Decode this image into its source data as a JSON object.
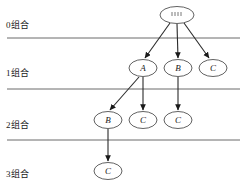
{
  "diagram": {
    "levels": [
      {
        "id": "level-0",
        "label": "0组合",
        "label_x": 6,
        "label_y": 18
      },
      {
        "id": "level-1",
        "label": "1组合",
        "label_x": 6,
        "label_y": 66
      },
      {
        "id": "level-2",
        "label": "2组合",
        "label_x": 6,
        "label_y": 118
      },
      {
        "id": "level-3",
        "label": "3组合",
        "label_x": 6,
        "label_y": 167
      }
    ],
    "dividers": [
      {
        "id": "divider-0-1",
        "y": 38
      },
      {
        "id": "divider-1-2",
        "y": 89
      },
      {
        "id": "divider-2-3",
        "y": 140
      }
    ],
    "divider_x_start": 7,
    "divider_x_end": 240,
    "nodes": [
      {
        "id": "root",
        "label": "",
        "level": 0,
        "cx": 177,
        "cy": 15,
        "rx": 17,
        "ry": 8.5,
        "is_root": true
      },
      {
        "id": "n1a",
        "label": "A",
        "level": 1,
        "cx": 143,
        "cy": 68,
        "rx": 14,
        "ry": 8.5,
        "is_root": false
      },
      {
        "id": "n1b",
        "label": "B",
        "level": 1,
        "cx": 178,
        "cy": 68,
        "rx": 14,
        "ry": 8.5,
        "is_root": false
      },
      {
        "id": "n1c",
        "label": "C",
        "level": 1,
        "cx": 213,
        "cy": 68,
        "rx": 14,
        "ry": 8.5,
        "is_root": false
      },
      {
        "id": "n2b",
        "label": "B",
        "level": 2,
        "cx": 108,
        "cy": 120,
        "rx": 14,
        "ry": 8.5,
        "is_root": false
      },
      {
        "id": "n2c1",
        "label": "C",
        "level": 2,
        "cx": 143,
        "cy": 120,
        "rx": 14,
        "ry": 8.5,
        "is_root": false
      },
      {
        "id": "n2c2",
        "label": "C",
        "level": 2,
        "cx": 178,
        "cy": 120,
        "rx": 14,
        "ry": 8.5,
        "is_root": false
      },
      {
        "id": "n3c",
        "label": "C",
        "level": 3,
        "cx": 108,
        "cy": 171,
        "rx": 14,
        "ry": 8.5,
        "is_root": false
      }
    ],
    "edges": [
      {
        "id": "edge-root-a",
        "from": "root",
        "to": "n1a",
        "x1": 170,
        "y1": 23,
        "x2": 145,
        "y2": 58
      },
      {
        "id": "edge-root-b",
        "from": "root",
        "to": "n1b",
        "x1": 177,
        "y1": 24,
        "x2": 178,
        "y2": 58
      },
      {
        "id": "edge-root-c",
        "from": "root",
        "to": "n1c",
        "x1": 184,
        "y1": 23,
        "x2": 209,
        "y2": 58
      },
      {
        "id": "edge-a-b",
        "from": "n1a",
        "to": "n2b",
        "x1": 139,
        "y1": 77,
        "x2": 110,
        "y2": 110
      },
      {
        "id": "edge-a-c",
        "from": "n1a",
        "to": "n2c1",
        "x1": 143,
        "y1": 77,
        "x2": 143,
        "y2": 110
      },
      {
        "id": "edge-b-c",
        "from": "n1b",
        "to": "n2c2",
        "x1": 178,
        "y1": 77,
        "x2": 178,
        "y2": 110
      },
      {
        "id": "edge-b-c3",
        "from": "n2b",
        "to": "n3c",
        "x1": 108,
        "y1": 129,
        "x2": 108,
        "y2": 161
      }
    ],
    "root_marks": [
      {
        "x1": 172,
        "y1": 12,
        "x2": 172,
        "y2": 16
      },
      {
        "x1": 175,
        "y1": 12,
        "x2": 175,
        "y2": 16
      },
      {
        "x1": 178,
        "y1": 12,
        "x2": 178,
        "y2": 16
      },
      {
        "x1": 181,
        "y1": 12,
        "x2": 181,
        "y2": 16
      }
    ],
    "colors": {
      "background": "#ffffff",
      "divider": "#6b6b6b",
      "node_stroke": "#3a3a3a",
      "node_fill": "#ffffff",
      "edge": "#2a2a2a",
      "text": "#1a1a1a"
    }
  }
}
